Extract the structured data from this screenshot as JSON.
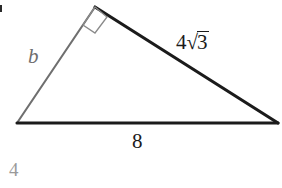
{
  "figure": {
    "type": "right-triangle-diagram",
    "background_color": "#ffffff",
    "stroke_dark": "#1b1b1b",
    "stroke_light": "#6e6e6e",
    "vertices": {
      "left": [
        17,
        123
      ],
      "apex": [
        95,
        7
      ],
      "right": [
        278,
        123
      ]
    },
    "right_angle_at": "apex"
  },
  "labels": {
    "leg_unknown": "b",
    "hypotenuse_radical_coefficient": "4",
    "hypotenuse_radical_sign": "√",
    "hypotenuse_radicand": "3",
    "hypotenuse_full": "4√3",
    "base": "8",
    "corner_number": "4"
  }
}
